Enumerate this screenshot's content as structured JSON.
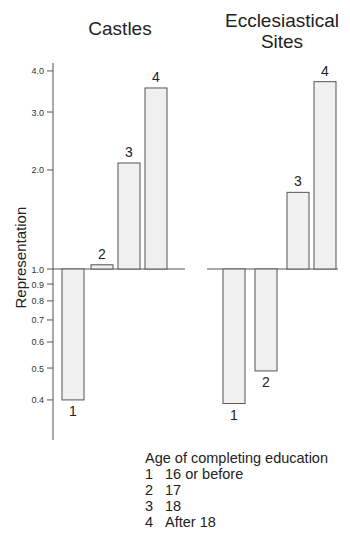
{
  "chart_data": {
    "type": "bar",
    "scale": "log",
    "ylabel": "Representation",
    "yticks": [
      0.4,
      0.5,
      0.6,
      0.7,
      0.8,
      0.9,
      1.0,
      2.0,
      3.0,
      4.0
    ],
    "ytick_labels": [
      "0.4",
      "0.5",
      "0.6",
      "0.7",
      "0.8",
      "0.9",
      "1.0",
      "2.0",
      "3.0",
      "4.0"
    ],
    "baseline": 1.0,
    "categories": [
      "1",
      "2",
      "3",
      "4"
    ],
    "panels": [
      {
        "title": "Castles",
        "values": [
          0.4,
          1.03,
          2.1,
          3.55
        ]
      },
      {
        "title": "Ecclesiastical Sites",
        "values": [
          0.39,
          0.49,
          1.71,
          3.71
        ]
      }
    ],
    "legend": {
      "title": "Age of completing education",
      "entries": [
        {
          "key": "1",
          "label": "16 or before"
        },
        {
          "key": "2",
          "label": "17"
        },
        {
          "key": "3",
          "label": "18"
        },
        {
          "key": "4",
          "label": "After 18"
        }
      ]
    }
  },
  "titles": {
    "castles": "Castles",
    "eccl_line1": "Ecclesiastical",
    "eccl_line2": "Sites"
  },
  "colors": {
    "bar_fill": "#f0f0f0",
    "stroke": "#555555"
  }
}
